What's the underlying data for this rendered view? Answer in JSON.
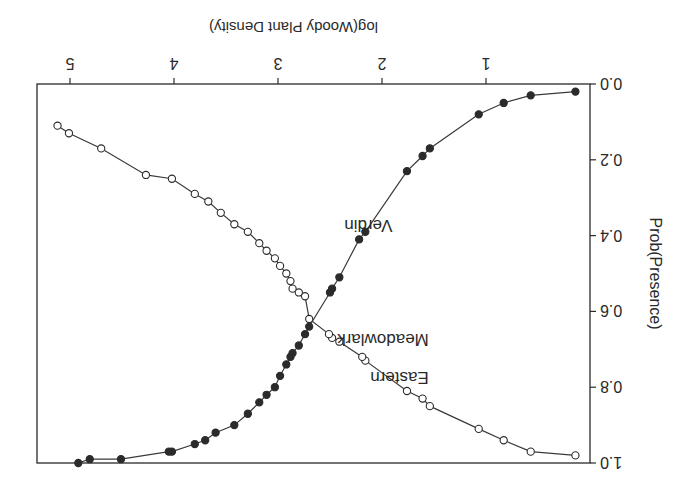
{
  "figure": {
    "rotation_deg": 180,
    "background": "#ffffff",
    "ink_color": "#2a2a2a"
  },
  "chart_data": {
    "type": "line",
    "title": "",
    "xlabel": "log(Woody Plant Density)",
    "ylabel": "Prob(Presence)",
    "xlim": [
      0.05,
      5.35
    ],
    "ylim": [
      0.0,
      1.0
    ],
    "x_ticks": [
      1,
      2,
      3,
      4,
      5
    ],
    "x_tick_labels": [
      "1",
      "2",
      "3",
      "4",
      "5"
    ],
    "y_ticks": [
      0.0,
      0.2,
      0.4,
      0.6,
      0.8,
      1.0
    ],
    "y_tick_labels": [
      "0.0",
      "0.2",
      "0.4",
      "0.6",
      "0.8",
      "1.0"
    ],
    "grid": false,
    "legend": null,
    "annotations": [
      {
        "text": "Verdin",
        "x": 1.9,
        "y": 0.36
      },
      {
        "text": "Eastern",
        "x": 1.55,
        "y": 0.76
      },
      {
        "text": "Meadowlark",
        "x": 1.55,
        "y": 0.66
      }
    ],
    "series": [
      {
        "name": "Verdin",
        "marker": "filled-circle",
        "x": [
          0.14,
          0.57,
          0.83,
          1.07,
          1.54,
          1.61,
          1.76,
          2.16,
          2.22,
          2.41,
          2.48,
          2.5,
          2.7,
          2.74,
          2.8,
          2.86,
          2.88,
          2.92,
          2.98,
          3.03,
          3.11,
          3.18,
          3.29,
          3.42,
          3.6,
          3.7,
          3.8,
          4.02,
          4.05,
          4.51,
          4.81,
          4.92
        ],
        "y": [
          0.02,
          0.03,
          0.05,
          0.08,
          0.17,
          0.19,
          0.23,
          0.39,
          0.41,
          0.51,
          0.54,
          0.55,
          0.64,
          0.66,
          0.69,
          0.71,
          0.72,
          0.74,
          0.77,
          0.8,
          0.82,
          0.84,
          0.87,
          0.9,
          0.92,
          0.94,
          0.95,
          0.97,
          0.97,
          0.99,
          0.99,
          1.0
        ]
      },
      {
        "name": "Eastern Meadowlark",
        "marker": "open-circle",
        "x": [
          0.14,
          0.57,
          0.83,
          1.07,
          1.54,
          1.61,
          1.76,
          2.16,
          2.19,
          2.41,
          2.48,
          2.51,
          2.7,
          2.74,
          2.8,
          2.86,
          2.88,
          2.92,
          2.98,
          3.03,
          3.11,
          3.18,
          3.29,
          3.42,
          3.55,
          3.67,
          3.8,
          4.02,
          4.27,
          4.7,
          5.01,
          5.12
        ],
        "y": [
          0.98,
          0.97,
          0.94,
          0.91,
          0.85,
          0.83,
          0.81,
          0.73,
          0.72,
          0.68,
          0.67,
          0.66,
          0.62,
          0.56,
          0.55,
          0.54,
          0.52,
          0.5,
          0.48,
          0.46,
          0.44,
          0.42,
          0.39,
          0.37,
          0.34,
          0.31,
          0.29,
          0.25,
          0.24,
          0.17,
          0.13,
          0.11
        ]
      }
    ]
  }
}
